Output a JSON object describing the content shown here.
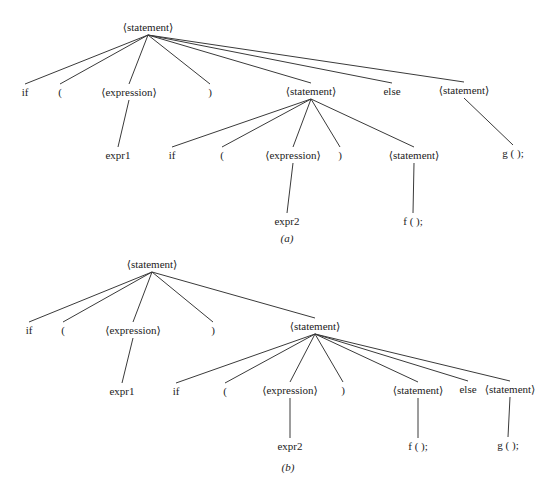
{
  "figures": [
    {
      "id": "a",
      "caption": "(a)",
      "nodes": [
        {
          "id": "a_root",
          "label": "⟨statement⟩",
          "x": 148,
          "y": 27
        },
        {
          "id": "a_if",
          "label": "if",
          "x": 25,
          "y": 92
        },
        {
          "id": "a_lp",
          "label": "(",
          "x": 60,
          "y": 92
        },
        {
          "id": "a_expr",
          "label": "⟨expression⟩",
          "x": 129,
          "y": 92
        },
        {
          "id": "a_rp",
          "label": ")",
          "x": 210,
          "y": 92
        },
        {
          "id": "a_stmt",
          "label": "⟨statement⟩",
          "x": 311,
          "y": 91
        },
        {
          "id": "a_else",
          "label": "else",
          "x": 392,
          "y": 91
        },
        {
          "id": "a_stmt2",
          "label": "⟨statement⟩",
          "x": 464,
          "y": 90
        },
        {
          "id": "a_expr1",
          "label": "expr1",
          "x": 118,
          "y": 155
        },
        {
          "id": "a_if2",
          "label": "if",
          "x": 172,
          "y": 155
        },
        {
          "id": "a_lp2",
          "label": "(",
          "x": 222,
          "y": 155
        },
        {
          "id": "a_expr2n",
          "label": "⟨expression⟩",
          "x": 293,
          "y": 155
        },
        {
          "id": "a_rp2",
          "label": ")",
          "x": 340,
          "y": 155
        },
        {
          "id": "a_stmt3",
          "label": "⟨statement⟩",
          "x": 414,
          "y": 155
        },
        {
          "id": "a_g",
          "label": "g ( );",
          "x": 513,
          "y": 153
        },
        {
          "id": "a_exprv2",
          "label": "expr2",
          "x": 287,
          "y": 221
        },
        {
          "id": "a_f",
          "label": "f (  );",
          "x": 413,
          "y": 221
        }
      ],
      "edges": [
        [
          "a_root",
          "a_if"
        ],
        [
          "a_root",
          "a_lp"
        ],
        [
          "a_root",
          "a_expr"
        ],
        [
          "a_root",
          "a_rp"
        ],
        [
          "a_root",
          "a_stmt"
        ],
        [
          "a_root",
          "a_else"
        ],
        [
          "a_root",
          "a_stmt2"
        ],
        [
          "a_expr",
          "a_expr1"
        ],
        [
          "a_stmt",
          "a_if2"
        ],
        [
          "a_stmt",
          "a_lp2"
        ],
        [
          "a_stmt",
          "a_expr2n"
        ],
        [
          "a_stmt",
          "a_rp2"
        ],
        [
          "a_stmt",
          "a_stmt3"
        ],
        [
          "a_stmt2",
          "a_g"
        ],
        [
          "a_expr2n",
          "a_exprv2"
        ],
        [
          "a_stmt3",
          "a_f"
        ]
      ],
      "caption_pos": {
        "x": 287,
        "y": 238
      }
    },
    {
      "id": "b",
      "caption": "(b)",
      "nodes": [
        {
          "id": "b_root",
          "label": "⟨statement⟩",
          "x": 152,
          "y": 264
        },
        {
          "id": "b_if",
          "label": "if",
          "x": 29,
          "y": 330
        },
        {
          "id": "b_lp",
          "label": "(",
          "x": 63,
          "y": 330
        },
        {
          "id": "b_expr",
          "label": "⟨expression⟩",
          "x": 133,
          "y": 330
        },
        {
          "id": "b_rp",
          "label": ")",
          "x": 213,
          "y": 330
        },
        {
          "id": "b_stmt",
          "label": "⟨statement⟩",
          "x": 315,
          "y": 326
        },
        {
          "id": "b_expr1",
          "label": "expr1",
          "x": 122,
          "y": 391
        },
        {
          "id": "b_if2",
          "label": "if",
          "x": 176,
          "y": 391
        },
        {
          "id": "b_lp2",
          "label": "(",
          "x": 225,
          "y": 391
        },
        {
          "id": "b_expr2n",
          "label": "⟨expression⟩",
          "x": 290,
          "y": 390
        },
        {
          "id": "b_rp2",
          "label": ")",
          "x": 343,
          "y": 390
        },
        {
          "id": "b_stmt3",
          "label": "⟨statement⟩",
          "x": 418,
          "y": 390
        },
        {
          "id": "b_else",
          "label": "else",
          "x": 468,
          "y": 389
        },
        {
          "id": "b_stmt4",
          "label": "⟨statement⟩",
          "x": 510,
          "y": 389
        },
        {
          "id": "b_exprv2",
          "label": "expr2",
          "x": 290,
          "y": 446
        },
        {
          "id": "b_f",
          "label": "f (  );",
          "x": 418,
          "y": 446
        },
        {
          "id": "b_g",
          "label": "g ( );",
          "x": 508,
          "y": 445
        }
      ],
      "edges": [
        [
          "b_root",
          "b_if"
        ],
        [
          "b_root",
          "b_lp"
        ],
        [
          "b_root",
          "b_expr"
        ],
        [
          "b_root",
          "b_rp"
        ],
        [
          "b_root",
          "b_stmt"
        ],
        [
          "b_expr",
          "b_expr1"
        ],
        [
          "b_stmt",
          "b_if2"
        ],
        [
          "b_stmt",
          "b_lp2"
        ],
        [
          "b_stmt",
          "b_expr2n"
        ],
        [
          "b_stmt",
          "b_rp2"
        ],
        [
          "b_stmt",
          "b_stmt3"
        ],
        [
          "b_stmt",
          "b_else"
        ],
        [
          "b_stmt",
          "b_stmt4"
        ],
        [
          "b_expr2n",
          "b_exprv2"
        ],
        [
          "b_stmt3",
          "b_f"
        ],
        [
          "b_stmt4",
          "b_g"
        ]
      ],
      "caption_pos": {
        "x": 288,
        "y": 467
      }
    }
  ]
}
